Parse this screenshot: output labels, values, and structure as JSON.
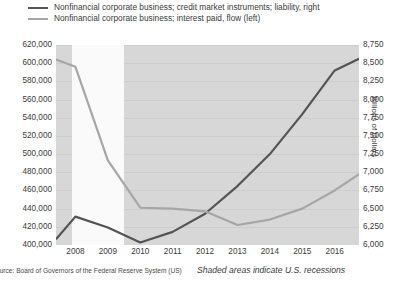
{
  "legend": {
    "items": [
      {
        "label": "Nonfinancial corporate business; credit market instruments; liability, right",
        "color": "#545454",
        "icon": "line-swatch-dark"
      },
      {
        "label": "Nonfinancial corporate business; interest paid, flow (left)",
        "color": "#a6a6a6",
        "icon": "line-swatch-light"
      }
    ]
  },
  "axes": {
    "left_ticks": [
      "620,000",
      "600,000",
      "580,000",
      "560,000",
      "540,000",
      "520,000",
      "500,000",
      "480,000",
      "460,000",
      "440,000",
      "420,000",
      "400,000"
    ],
    "right_ticks": [
      "8,750",
      "8,500",
      "8,250",
      "8,000",
      "7,750",
      "7,500",
      "7,250",
      "7,000",
      "6,750",
      "6,500",
      "6,250",
      "6,000"
    ],
    "x_ticks": [
      "2008",
      "2009",
      "2010",
      "2011",
      "2012",
      "2013",
      "2014",
      "2015",
      "2016"
    ],
    "right_axis_title": "Billions of Dollars"
  },
  "footer": {
    "source": "ource: Board of Governors of the Federal Reserve System (US)",
    "recession_note": "Shaded areas indicate U.S. recessions"
  },
  "chart_data": {
    "type": "line",
    "title": "",
    "xlabel": "",
    "ylabel": "",
    "grid": true,
    "legend_position": "top-left",
    "x": [
      2007.4,
      2008,
      2009,
      2010,
      2011,
      2012,
      2013,
      2014,
      2015,
      2016,
      2016.75
    ],
    "x_range": [
      2007.4,
      2016.75
    ],
    "series": [
      {
        "name": "Nonfinancial corporate business; credit market instruments; liability, right",
        "axis": "right",
        "color": "#545454",
        "ylabel": "Billions of Dollars",
        "ylim": [
          6000,
          8750
        ],
        "values": [
          6080,
          6390,
          6240,
          6035,
          6180,
          6430,
          6810,
          7250,
          7800,
          8400,
          8560
        ]
      },
      {
        "name": "Nonfinancial corporate business; interest paid, flow (left)",
        "axis": "left",
        "color": "#a6a6a6",
        "ylim": [
          400000,
          620000
        ],
        "values": [
          604000,
          596000,
          493000,
          441000,
          440000,
          437000,
          422000,
          428000,
          440000,
          460000,
          478000
        ]
      }
    ],
    "shaded_regions": [
      {
        "label": "U.S. recession",
        "x_start": 2007.9,
        "x_end": 2009.5,
        "color": "#fafafa"
      }
    ]
  }
}
